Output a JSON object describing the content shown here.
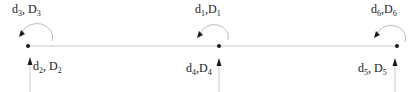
{
  "diagram": {
    "type": "beam-element-dof",
    "line_color": "#c8c8c8",
    "ink_color": "#1a1a1a",
    "nodes": [
      {
        "id": "left",
        "x": 28,
        "y": 46,
        "rotation_label": {
          "d": "d",
          "d_sub": "3",
          "D": "D",
          "D_sub": "3",
          "sep": ", "
        },
        "axial_label": {
          "d": "d",
          "d_sub": "2",
          "D": "D",
          "D_sub": "2",
          "sep": ", "
        }
      },
      {
        "id": "middle",
        "x": 219,
        "y": 46,
        "rotation_label": {
          "d": "d",
          "d_sub": "1",
          "D": "D",
          "D_sub": "1",
          "sep": ","
        },
        "axial_label": {
          "d": "d",
          "d_sub": "4",
          "D": "D",
          "D_sub": "4",
          "sep": ","
        }
      },
      {
        "id": "right",
        "x": 397,
        "y": 46,
        "rotation_label": {
          "d": "d",
          "d_sub": "6",
          "D": "D",
          "D_sub": "6",
          "sep": ","
        },
        "axial_label": {
          "d": "d",
          "d_sub": "5",
          "D": "D",
          "D_sub": "5",
          "sep": ", "
        }
      }
    ]
  }
}
